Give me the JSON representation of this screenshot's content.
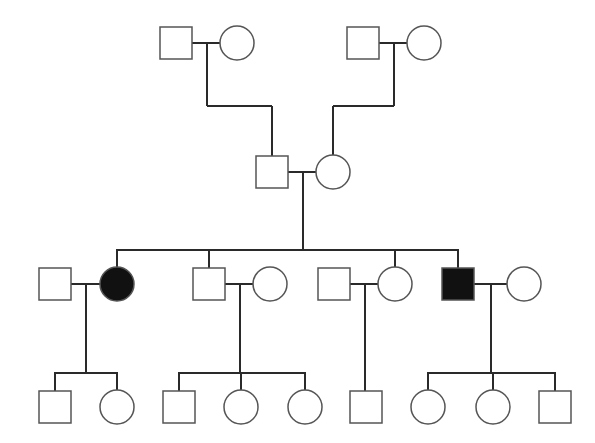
{
  "diagram": {
    "type": "pedigree",
    "colors": {
      "line": "#2a2a2a",
      "affected_fill": "#111111",
      "unaffected_fill": "#ffffff",
      "background": "#ffffff"
    },
    "legend": {
      "square": "male",
      "circle": "female",
      "filled": "affected",
      "open": "unaffected"
    },
    "generations": [
      {
        "label": "I",
        "individuals": [
          {
            "id": "I-1",
            "sex": "male",
            "affected": false,
            "cx": 176,
            "cy": 43
          },
          {
            "id": "I-2",
            "sex": "female",
            "affected": false,
            "cx": 237,
            "cy": 43
          },
          {
            "id": "I-3",
            "sex": "male",
            "affected": false,
            "cx": 363,
            "cy": 43
          },
          {
            "id": "I-4",
            "sex": "female",
            "affected": false,
            "cx": 424,
            "cy": 43
          }
        ]
      },
      {
        "label": "II",
        "individuals": [
          {
            "id": "II-1",
            "sex": "male",
            "affected": false,
            "cx": 272,
            "cy": 172
          },
          {
            "id": "II-2",
            "sex": "female",
            "affected": false,
            "cx": 333,
            "cy": 172
          }
        ]
      },
      {
        "label": "III",
        "individuals": [
          {
            "id": "III-1",
            "sex": "male",
            "affected": false,
            "cx": 55,
            "cy": 284
          },
          {
            "id": "III-2",
            "sex": "female",
            "affected": true,
            "cx": 117,
            "cy": 284
          },
          {
            "id": "III-3",
            "sex": "male",
            "affected": false,
            "cx": 209,
            "cy": 284
          },
          {
            "id": "III-4",
            "sex": "female",
            "affected": false,
            "cx": 270,
            "cy": 284
          },
          {
            "id": "III-5",
            "sex": "male",
            "affected": false,
            "cx": 334,
            "cy": 284
          },
          {
            "id": "III-6",
            "sex": "female",
            "affected": false,
            "cx": 395,
            "cy": 284
          },
          {
            "id": "III-7",
            "sex": "male",
            "affected": true,
            "cx": 458,
            "cy": 284
          },
          {
            "id": "III-8",
            "sex": "female",
            "affected": false,
            "cx": 524,
            "cy": 284
          }
        ]
      },
      {
        "label": "IV",
        "individuals": [
          {
            "id": "IV-1",
            "sex": "male",
            "affected": false,
            "cx": 55,
            "cy": 407
          },
          {
            "id": "IV-2",
            "sex": "female",
            "affected": false,
            "cx": 117,
            "cy": 407
          },
          {
            "id": "IV-3",
            "sex": "male",
            "affected": false,
            "cx": 179,
            "cy": 407
          },
          {
            "id": "IV-4",
            "sex": "female",
            "affected": false,
            "cx": 241,
            "cy": 407
          },
          {
            "id": "IV-5",
            "sex": "female",
            "affected": false,
            "cx": 305,
            "cy": 407
          },
          {
            "id": "IV-6",
            "sex": "male",
            "affected": false,
            "cx": 366,
            "cy": 407
          },
          {
            "id": "IV-7",
            "sex": "female",
            "affected": false,
            "cx": 428,
            "cy": 407
          },
          {
            "id": "IV-8",
            "sex": "female",
            "affected": false,
            "cx": 493,
            "cy": 407
          },
          {
            "id": "IV-9",
            "sex": "male",
            "affected": false,
            "cx": 555,
            "cy": 407
          }
        ]
      }
    ],
    "matings": [
      {
        "partners": [
          "I-1",
          "I-2"
        ],
        "children": [
          "II-1"
        ]
      },
      {
        "partners": [
          "I-3",
          "I-4"
        ],
        "children": [
          "II-2"
        ]
      },
      {
        "partners": [
          "II-1",
          "II-2"
        ],
        "children": [
          "III-2",
          "III-3",
          "III-6",
          "III-7"
        ]
      },
      {
        "partners": [
          "III-1",
          "III-2"
        ],
        "children": [
          "IV-1",
          "IV-2"
        ]
      },
      {
        "partners": [
          "III-3",
          "III-4"
        ],
        "children": [
          "IV-3",
          "IV-4",
          "IV-5"
        ]
      },
      {
        "partners": [
          "III-5",
          "III-6"
        ],
        "children": [
          "IV-6"
        ]
      },
      {
        "partners": [
          "III-7",
          "III-8"
        ],
        "children": [
          "IV-7",
          "IV-8",
          "IV-9"
        ]
      }
    ]
  }
}
